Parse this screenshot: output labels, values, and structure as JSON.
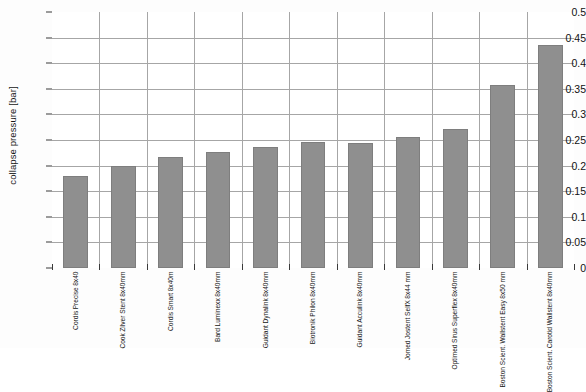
{
  "chart_data": {
    "type": "bar",
    "title": "",
    "subtitle": "",
    "xlabel": "",
    "ylabel": "collapse pressure [bar]",
    "ylim": [
      0,
      0.5
    ],
    "ytick_step": 0.05,
    "yticks": [
      "0.5",
      "0.45",
      "0.4",
      "0.35",
      "0.3",
      "0.25",
      "0.2",
      "0.15",
      "0.1",
      "0.05",
      "0"
    ],
    "ytick_values": [
      0.5,
      0.45,
      0.4,
      0.35,
      0.3,
      0.25,
      0.2,
      0.15,
      0.1,
      0.05,
      0
    ],
    "grid": "horizontal-and-vertical",
    "legend": "none",
    "bar_color": "#8f8f8f",
    "bar_border_color": "#7e7e7e",
    "plot_background": "#ffffff",
    "grid_color": "#a6a6a6",
    "axis_color": "#3a3a3a",
    "categories": [
      [
        "Cordis",
        "Precise",
        "8x40"
      ],
      [
        "Cook",
        "Zilver Stent",
        "8x40mm"
      ],
      [
        "Cordis",
        "Smart",
        "8x40m"
      ],
      [
        "Bard",
        "Luminexx",
        "8x40mm"
      ],
      [
        "Guidant",
        "Dynalink",
        "8x40mm"
      ],
      [
        "Biotronik Philon",
        "8x40mm"
      ],
      [
        "Guidant",
        "Acculink",
        "8x40mm"
      ],
      [
        "Jomed",
        "Jostent SelfX",
        "8x44 mm"
      ],
      [
        "Optimed",
        "Sirus Superflex",
        "8x40mm"
      ],
      [
        "Boston Scient.",
        "Wallstent Easy",
        "8x50 mm"
      ],
      [
        "Boston Scient.",
        "Carotid Wallstent",
        "8x40mm"
      ]
    ],
    "values": [
      0.18,
      0.199,
      0.217,
      0.227,
      0.237,
      0.246,
      0.245,
      0.256,
      0.272,
      0.357,
      0.435
    ]
  }
}
